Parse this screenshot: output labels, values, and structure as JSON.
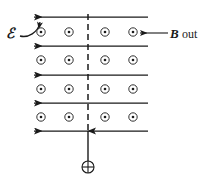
{
  "figure": {
    "background_color": "#ffffff",
    "ink_color": "#1a1a1a",
    "width": 208,
    "height": 181
  },
  "labels": {
    "emf": "ℰ",
    "emf_name": "script-E-emf",
    "b_field_symbol": "B",
    "b_field_direction": "out",
    "charge_symbol": "⊕"
  },
  "field_lines": {
    "count": 4,
    "direction": "left",
    "y_positions": [
      17,
      46,
      75,
      103,
      131
    ],
    "x_start": 33,
    "x_end": 148,
    "arrow_end": "left"
  },
  "field_dots": {
    "meaning": "magnetic-field-out-of-page",
    "columns_x": [
      41,
      69,
      105,
      133
    ],
    "rows_y": [
      32,
      60,
      89,
      117
    ],
    "count": 16,
    "outer_radius": 4.2,
    "inner_radius": 1.3
  },
  "dashed_center_line": {
    "x": 88,
    "y_start": 14,
    "y_end": 134,
    "dash": "6 4"
  },
  "charge": {
    "symbol": "plus",
    "center_x": 88,
    "center_y": 167,
    "radius": 6,
    "velocity_arrow": {
      "from_y": 161,
      "to_y": 131,
      "direction": "up"
    }
  },
  "emf_pointer": {
    "description": "curved arrow from emf label to top field line"
  },
  "b_pointer": {
    "description": "straight arrow from B out label to rightmost top dot",
    "x_start": 168,
    "x_end": 140,
    "y": 33
  }
}
